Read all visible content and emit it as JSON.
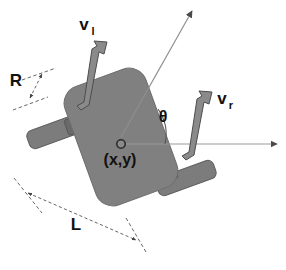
{
  "figure": {
    "type": "diagram",
    "background_color": "#ffffff",
    "labels": {
      "v_left_base": "v",
      "v_left_sub": "l",
      "v_right_base": "v",
      "v_right_sub": "r",
      "wheel_radius": "R",
      "wheel_base": "L",
      "heading_angle": "θ",
      "center_position": "(x,y)"
    },
    "colors": {
      "body_fill": "#808080",
      "body_stroke": "#6e6e6e",
      "wheel_fill": "#7c7c7c",
      "wheel_stroke": "#5f5f5f",
      "axle_fill": "#6a6a6a",
      "velocity_arrow_fill": "#8a8a8a",
      "velocity_arrow_stroke": "#4d4d4d",
      "axis_stroke": "#9a9a9a",
      "dimension_stroke": "#555555",
      "label_color": "#111111",
      "center_dot_fill": "#8a8a8a",
      "center_dot_stroke": "#2b2b2b"
    },
    "geometry": {
      "body_center": [
        121,
        137
      ],
      "body_rotation_deg": -20,
      "body_width": 86,
      "body_height": 126,
      "corner_radius": 18,
      "left_wheel_center": [
        57,
        131
      ],
      "right_wheel_center": [
        186,
        178
      ],
      "wheel_length": 62,
      "wheel_thickness": 19,
      "x_axis_end": [
        279,
        145
      ],
      "heading_axis_end": [
        193,
        8
      ]
    },
    "elements": [
      "robot-body",
      "left-wheel",
      "right-wheel",
      "left-velocity-arrow",
      "right-velocity-arrow",
      "heading-axis-arrow",
      "horizontal-axis-arrow",
      "heading-angle-arc",
      "center-point",
      "wheel-radius-dimension",
      "wheel-base-dimension"
    ]
  }
}
